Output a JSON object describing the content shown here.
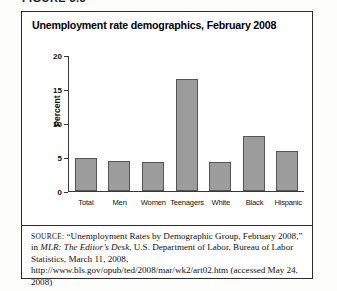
{
  "figure": {
    "header_label": "FIGURE 3.3",
    "title": "Unemployment rate demographics, February 2008"
  },
  "chart_data": {
    "type": "bar",
    "title": "Unemployment rate demographics, February 2008",
    "xlabel": "",
    "ylabel": "Percent",
    "categories": [
      "Total",
      "Men",
      "Women",
      "Teenagers",
      "White",
      "Black",
      "Hispanic"
    ],
    "values": [
      4.8,
      4.3,
      4.2,
      16.4,
      4.2,
      8.0,
      5.9
    ],
    "ylim": [
      0,
      20
    ],
    "yticks": [
      0,
      5,
      10,
      15,
      20
    ],
    "ytick_labels": [
      "0",
      "5",
      "10",
      "15",
      "20"
    ],
    "grid": false,
    "legend": null,
    "bar_color": "#9c9c9c",
    "bar_border_color": "#555555",
    "axis_color": "#3a3a3a"
  },
  "source": {
    "label": "SOURCE:",
    "part1": " “Unemployment Rates by Demographic Group, February 2008,” in ",
    "italic": "MLR: The Editor’s Desk",
    "part2": ", U.S. Department of Labor, Bureau of Labor Statistics, March 11, 2008, http://www.bls.gov/opub/ted/2008/mar/wk2/art02.htm (accessed May 24, 2008)"
  }
}
